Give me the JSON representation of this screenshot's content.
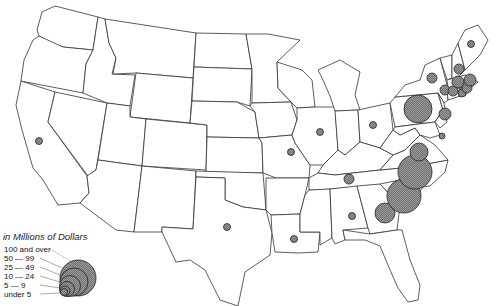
{
  "map": {
    "type": "proportional-symbol map",
    "region": "United States (contiguous)",
    "legend": {
      "title": "in Millions of Dollars",
      "classes": [
        {
          "label": "100 and over",
          "r": 18
        },
        {
          "label": "50 —  99",
          "r": 14
        },
        {
          "label": "25 —  49",
          "r": 10.5
        },
        {
          "label": "10 —  24",
          "r": 7.5
        },
        {
          "label": "5 —   9",
          "r": 5
        },
        {
          "label": "under  5",
          "r": 3.5
        }
      ]
    },
    "symbols": [
      {
        "location": "California (San Francisco area)",
        "x": 39,
        "y": 141,
        "r": 3.5,
        "class": "under 5"
      },
      {
        "location": "Texas",
        "x": 227,
        "y": 227,
        "r": 3.5,
        "class": "under 5"
      },
      {
        "location": "Louisiana",
        "x": 294,
        "y": 239,
        "r": 3.5,
        "class": "under 5"
      },
      {
        "location": "Missouri",
        "x": 291,
        "y": 152,
        "r": 3.5,
        "class": "under 5"
      },
      {
        "location": "Illinois",
        "x": 320,
        "y": 132,
        "r": 3.5,
        "class": "under 5"
      },
      {
        "location": "Ohio",
        "x": 373,
        "y": 125,
        "r": 3.5,
        "class": "under 5"
      },
      {
        "location": "Tennessee",
        "x": 349,
        "y": 179,
        "r": 5,
        "class": "5 - 9"
      },
      {
        "location": "Alabama",
        "x": 352,
        "y": 216,
        "r": 3.5,
        "class": "under 5"
      },
      {
        "location": "Georgia",
        "x": 385,
        "y": 213,
        "r": 10,
        "class": "25 - 49"
      },
      {
        "location": "Virginia",
        "x": 419,
        "y": 152,
        "r": 9,
        "class": "25 - 49"
      },
      {
        "location": "North Carolina",
        "x": 415,
        "y": 172,
        "r": 17,
        "class": "100 and over"
      },
      {
        "location": "South Carolina",
        "x": 404,
        "y": 196,
        "r": 17,
        "class": "100 and over"
      },
      {
        "location": "Pennsylvania",
        "x": 418,
        "y": 109,
        "r": 14,
        "class": "50 - 99"
      },
      {
        "location": "New York (upstate)",
        "x": 432,
        "y": 78,
        "r": 5,
        "class": "5 - 9"
      },
      {
        "location": "New Jersey",
        "x": 445,
        "y": 114,
        "r": 6,
        "class": "10 - 24"
      },
      {
        "location": "Maryland / Delaware",
        "x": 442,
        "y": 136,
        "r": 3,
        "class": "under 5"
      },
      {
        "location": "Maine",
        "x": 471,
        "y": 44,
        "r": 3.5,
        "class": "under 5"
      },
      {
        "location": "New Hampshire",
        "x": 459,
        "y": 69,
        "r": 5,
        "class": "5 - 9"
      },
      {
        "location": "Massachusetts",
        "x": 458,
        "y": 82,
        "r": 6,
        "class": "10 - 24"
      },
      {
        "location": "Massachusetts (east)",
        "x": 470,
        "y": 80,
        "r": 6,
        "class": "10 - 24"
      },
      {
        "location": "Rhode Island",
        "x": 467,
        "y": 88,
        "r": 5,
        "class": "5 - 9"
      },
      {
        "location": "Connecticut",
        "x": 453,
        "y": 91,
        "r": 5,
        "class": "5 - 9"
      },
      {
        "location": "Connecticut (south)",
        "x": 462,
        "y": 93,
        "r": 4,
        "class": "under 5"
      },
      {
        "location": "New York (Hudson)",
        "x": 445,
        "y": 90,
        "r": 5,
        "class": "5 - 9"
      }
    ]
  }
}
